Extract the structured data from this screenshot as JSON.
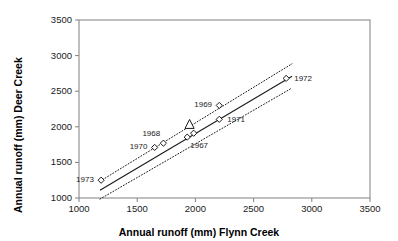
{
  "chart_data": {
    "type": "scatter",
    "title": "",
    "xlabel": "Annual runoff (mm) Flynn Creek",
    "ylabel": "Annual runoff (mm) Deer Creek",
    "xlim": [
      1000,
      3500
    ],
    "ylim": [
      1000,
      3500
    ],
    "xticks": [
      1000,
      1500,
      2000,
      2500,
      3000,
      3500
    ],
    "yticks": [
      1000,
      1500,
      2000,
      2500,
      3000,
      3500
    ],
    "xtick_labels": [
      "1000",
      "1500",
      "2000",
      "2500",
      "3000",
      "3500"
    ],
    "ytick_labels": [
      "1000",
      "1500",
      "2000",
      "2500",
      "3000",
      "3500"
    ],
    "grid": false,
    "legend": "none",
    "series": [
      {
        "name": "Annual runoff pairs",
        "marker": "diamond-open",
        "points": [
          {
            "label": "1973",
            "x": 1190,
            "y": 1250,
            "label_pos": "left"
          },
          {
            "label": "1970",
            "x": 1650,
            "y": 1710,
            "label_pos": "left"
          },
          {
            "label": "1968",
            "x": 1725,
            "y": 1770,
            "label_pos": "above-left"
          },
          {
            "label": "1967",
            "x": 1930,
            "y": 1855,
            "label_pos": "below-right"
          },
          {
            "label": "",
            "x": 1985,
            "y": 1910,
            "label_pos": "none"
          },
          {
            "label": "1969",
            "x": 2205,
            "y": 2300,
            "label_pos": "left"
          },
          {
            "label": "1971",
            "x": 2205,
            "y": 2105,
            "label_pos": "right"
          },
          {
            "label": "1972",
            "x": 2780,
            "y": 2680,
            "label_pos": "right"
          }
        ]
      },
      {
        "name": "Outlier marker",
        "marker": "triangle-open",
        "points": [
          {
            "label": "",
            "x": 1950,
            "y": 2030,
            "label_pos": "none"
          }
        ]
      }
    ],
    "fit_line": {
      "name": "regression line",
      "style": "solid",
      "x": [
        1180,
        2830
      ],
      "y": [
        1110,
        2710
      ]
    },
    "confidence_bands": [
      {
        "name": "upper band",
        "style": "dotted",
        "x": [
          1180,
          2830
        ],
        "y": [
          1235,
          2885
        ]
      },
      {
        "name": "lower band",
        "style": "dotted",
        "x": [
          1180,
          2830
        ],
        "y": [
          985,
          2545
        ]
      }
    ],
    "colors": {
      "axis": "#808080",
      "marker": "#1a1a1a",
      "line": "#1a1a1a",
      "text": "#1a1a1a",
      "background": "#ffffff"
    }
  }
}
